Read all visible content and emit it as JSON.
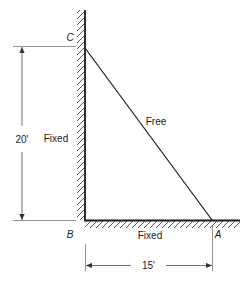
{
  "diagram": {
    "points": {
      "c": "C",
      "b": "B",
      "a": "A"
    },
    "edge_labels": {
      "wall_support": "Fixed",
      "ground_support": "Fixed",
      "hypotenuse": "Free"
    },
    "dimensions": {
      "vertical": "20'",
      "horizontal": "15'"
    },
    "colors": {
      "line": "#1a1a1a",
      "hatch": "#555555",
      "dimension": "#333333",
      "background": "#ffffff"
    }
  }
}
